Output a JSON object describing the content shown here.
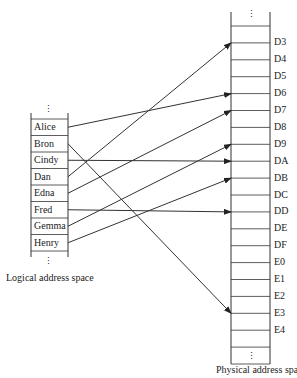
{
  "logical": {
    "caption": "Logical address space",
    "ellipsis": "⋮",
    "entries": [
      "Alice",
      "Bron",
      "Cindy",
      "Dan",
      "Edna",
      "Fred",
      "Gemma",
      "Henry"
    ]
  },
  "physical": {
    "caption": "Physical address space",
    "ellipsis": "⋮",
    "frames": [
      "D3",
      "D4",
      "D5",
      "D6",
      "D7",
      "D8",
      "D9",
      "DA",
      "DB",
      "DC",
      "DD",
      "DE",
      "DF",
      "E0",
      "E1",
      "E2",
      "E3",
      "E4"
    ]
  },
  "mappings": [
    {
      "from": "Alice",
      "to": "D6"
    },
    {
      "from": "Bron",
      "to": "E3"
    },
    {
      "from": "Cindy",
      "to": "DA"
    },
    {
      "from": "Dan",
      "to": "D3"
    },
    {
      "from": "Edna",
      "to": "D7"
    },
    {
      "from": "Fred",
      "to": "DD"
    },
    {
      "from": "Gemma",
      "to": "D9"
    },
    {
      "from": "Henry",
      "to": "DB"
    }
  ]
}
